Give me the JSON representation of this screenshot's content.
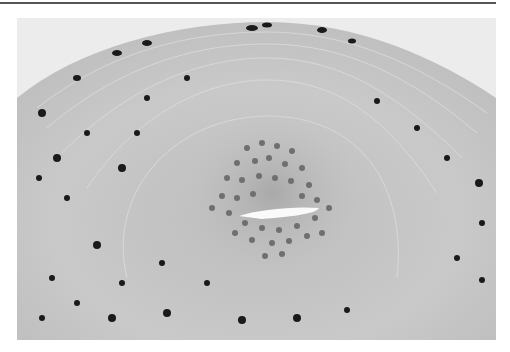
{
  "figure": {
    "background_color": "#ececec",
    "tissue_color": "#c8c8c8",
    "nucleus_color": "#1a1a1a",
    "lumen_color": "#fafafa"
  },
  "side_label": {
    "text": ""
  }
}
